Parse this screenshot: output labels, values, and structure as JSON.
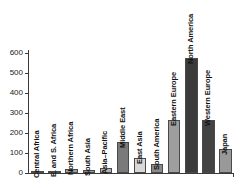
{
  "chart_data": {
    "type": "bar",
    "title": "",
    "subtitle": "",
    "xlabel": "",
    "ylabel": "",
    "ylim": [
      0,
      600
    ],
    "yticks": [
      0,
      100,
      200,
      300,
      400,
      500,
      600
    ],
    "ytick_labels": [
      "0",
      "100",
      "200",
      "300",
      "400",
      "500",
      "600"
    ],
    "grid": false,
    "legend": null,
    "categories": [
      "Central Africa",
      "E. and S. Africa",
      "Northern Africa",
      "South Asia",
      "Asia–Pacific",
      "Middle East",
      "East Asia",
      "South America",
      "Eastern Europe",
      "North America",
      "Western Europe",
      "Japan"
    ],
    "values": [
      3,
      8,
      20,
      15,
      25,
      155,
      75,
      45,
      265,
      575,
      265,
      120
    ],
    "bar_colors": [
      "#8f8f8f",
      "#8f8f8f",
      "#a0a0a0",
      "#9a9a9a",
      "#b0b0b0",
      "#7a7a7a",
      "#d8d8d8",
      "#8a8a8a",
      "#9e9e9e",
      "#3b3b3b",
      "#434343",
      "#999999"
    ]
  },
  "axis": {
    "axis_color": "#3a3a3a",
    "tick_text_color": "#1a1a1a"
  }
}
